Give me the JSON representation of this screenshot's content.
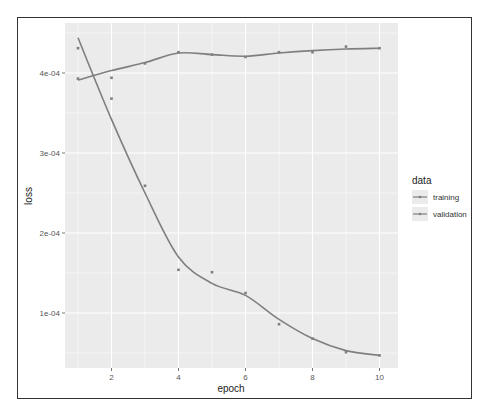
{
  "chart_data": {
    "type": "line",
    "title": "",
    "xlabel": "epoch",
    "ylabel": "loss",
    "x": [
      1,
      2,
      3,
      4,
      5,
      6,
      7,
      8,
      9,
      10
    ],
    "x_ticks": [
      "2",
      "4",
      "6",
      "8",
      "10"
    ],
    "y_ticks": [
      "1e-04",
      "2e-04",
      "3e-04",
      "4e-04"
    ],
    "xlim": [
      0.65,
      10.5
    ],
    "ylim": [
      3e-05,
      0.00046
    ],
    "grid": true,
    "legend_position": "right",
    "legend_title": "data",
    "series": [
      {
        "name": "training",
        "values": [
          0.000431,
          0.000368,
          0.000259,
          0.000154,
          0.000151,
          0.000125,
          8.6e-05,
          6.8e-05,
          5.1e-05,
          4.7e-05
        ],
        "smooth": [
          0.000444,
          0.000342,
          0.00025,
          0.00017,
          0.000137,
          0.000122,
          9.2e-05,
          6.8e-05,
          5.3e-05,
          4.7e-05
        ]
      },
      {
        "name": "validation",
        "values": [
          0.000393,
          0.000394,
          0.000412,
          0.000426,
          0.000423,
          0.00042,
          0.000426,
          0.000426,
          0.000433,
          0.000431
        ],
        "smooth": [
          0.000391,
          0.000403,
          0.000413,
          0.000425,
          0.000423,
          0.000421,
          0.000425,
          0.000428,
          0.00043,
          0.000431
        ]
      }
    ],
    "colors": {
      "line": "#7f7f7f",
      "panel": "#ebebeb",
      "grid": "#ffffff"
    }
  },
  "legend": {
    "title": "data",
    "items": [
      {
        "label": "training"
      },
      {
        "label": "validation"
      }
    ]
  },
  "axes": {
    "xlabel": "epoch",
    "ylabel": "loss"
  }
}
